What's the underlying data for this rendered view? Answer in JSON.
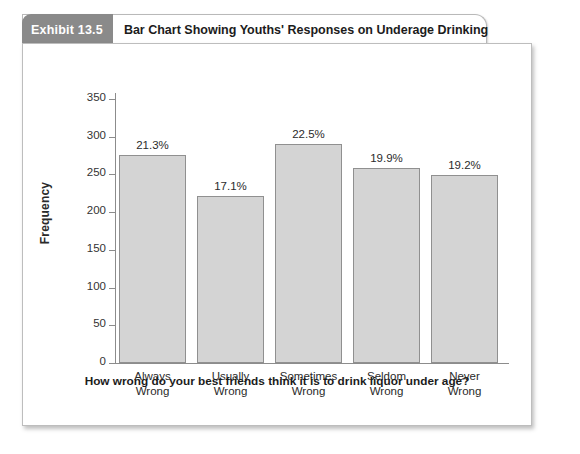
{
  "exhibit": {
    "badge": "Exhibit 13.5",
    "title": "Bar Chart Showing Youths' Responses on Underage Drinking"
  },
  "chart_data": {
    "type": "bar",
    "title": "",
    "xlabel": "How wrong do your best friends think it is to drink liquor under age?",
    "ylabel": "Frequency",
    "categories": [
      "Always Wrong",
      "Usually Wrong",
      "Sometimes Wrong",
      "Seldom Wrong",
      "Never Wrong"
    ],
    "category_lines": [
      [
        "Always",
        "Wrong"
      ],
      [
        "Usually",
        "Wrong"
      ],
      [
        "Sometimes",
        "Wrong"
      ],
      [
        "Seldom",
        "Wrong"
      ],
      [
        "Never",
        "Wrong"
      ]
    ],
    "values": [
      276,
      221,
      291,
      258,
      249
    ],
    "data_labels": [
      "21.3%",
      "17.1%",
      "22.5%",
      "19.9%",
      "19.2%"
    ],
    "ylim": [
      0,
      350
    ],
    "yticks": [
      0,
      50,
      100,
      150,
      200,
      250,
      300,
      350
    ],
    "ytick_labels": [
      "0",
      "50",
      "100",
      "150",
      "200",
      "250",
      "300",
      "350"
    ],
    "grid": false,
    "legend": false,
    "bar_color": "#d4d4d4",
    "bar_border_color": "#909090",
    "axis_color": "#8c8c8c"
  }
}
